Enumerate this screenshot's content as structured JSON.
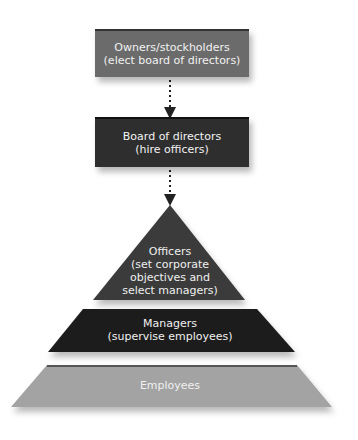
{
  "diagram": {
    "type": "corporate-hierarchy",
    "colors": {
      "owners": "#6b6b6b",
      "board": "#2e2e2e",
      "officers": "#3a3a3a",
      "managers": "#1c1c1c",
      "employees": "#a3a3a3",
      "text": "#f2f2f2"
    },
    "nodes": [
      {
        "id": "owners",
        "line1": "Owners/stockholders",
        "line2": "(elect board of directors)"
      },
      {
        "id": "board",
        "line1": "Board of directors",
        "line2": "(hire officers)"
      },
      {
        "id": "officers",
        "line1": "Officers",
        "line2": "(set corporate",
        "line3": "objectives and",
        "line4": "select managers)"
      },
      {
        "id": "managers",
        "line1": "Managers",
        "line2": "(supervise employees)"
      },
      {
        "id": "employees",
        "line1": "Employees"
      }
    ],
    "edges": [
      {
        "from": "owners",
        "to": "board",
        "style": "dotted-arrow"
      },
      {
        "from": "board",
        "to": "officers",
        "style": "dotted-arrow"
      }
    ]
  }
}
